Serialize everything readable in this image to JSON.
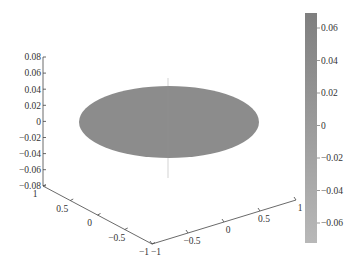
{
  "chart_data": {
    "type": "surface3d",
    "title": "",
    "surface": {
      "shape": "disk",
      "radius": 1,
      "z_value": 0,
      "color": "#8c8c8c"
    },
    "axes": {
      "x": {
        "label": "",
        "ticks": [
          "-1",
          "-0.5",
          "0",
          "0.5",
          "1"
        ],
        "range": [
          -1,
          1
        ]
      },
      "y": {
        "label": "",
        "ticks": [
          "1",
          "0.5",
          "0",
          "-0.5",
          "-1"
        ],
        "range": [
          -1,
          1
        ]
      },
      "z": {
        "label": "",
        "ticks": [
          "0.08",
          "0.06",
          "0.04",
          "0.02",
          "0",
          "-0.02",
          "-0.04",
          "-0.06",
          "-0.08"
        ],
        "range": [
          -0.08,
          0.08
        ]
      }
    },
    "colorbar": {
      "ticks": [
        "0.06",
        "0.04",
        "0.02",
        "0",
        "-0.02",
        "-0.04",
        "-0.06"
      ],
      "range": [
        -0.07,
        0.07
      ],
      "color_top": "#7f7f7f",
      "color_bottom": "#b8b8b8",
      "position": "right"
    },
    "grid": false,
    "legend": null
  }
}
